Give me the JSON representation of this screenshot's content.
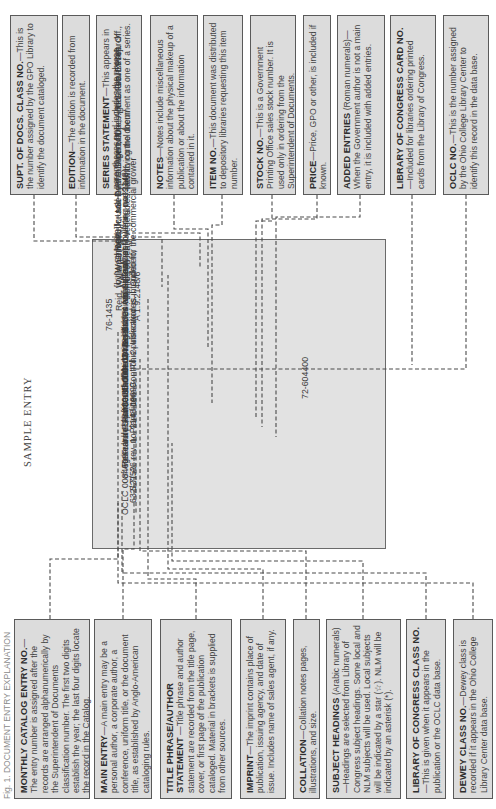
{
  "heading": "SAMPLE ENTRY",
  "caption_strip": "Fig. 1. DOCUMENT ENTRY EXPLANATION",
  "top_boxes": [
    {
      "title": "SUPT. OF DOCS. CLASS NO.",
      "text": "—This is the number assigned by the GPO Library to identify the document cataloged."
    },
    {
      "title": "EDITION",
      "text": "—The edition is recorded from information in the document."
    },
    {
      "title": "SERIES STATEMENT",
      "text": "—This appears in parentheses and includes the phrase identifying the document as one of a series."
    },
    {
      "title": "NOTES",
      "text": "—Notes include miscellaneous information about the physical makeup of a publication or about the information contained in it."
    },
    {
      "title": "ITEM NO.",
      "text": "—This document was distributed to depository libraries requesting this item number."
    },
    {
      "title": "STOCK NO.",
      "text": "—This is a Government Printing Office sales stock number. It is used only in ordering from the Superintendent of Documents."
    },
    {
      "title": "PRICE",
      "text": "—Price, GPO or other, is included if known."
    },
    {
      "title": "ADDED ENTRIES",
      "text": " (Roman numerals)—When the Government author is not a main entry, it is included with added entries."
    },
    {
      "title": "LIBRARY OF CONGRESS CARD NO.",
      "text": "—Included for libraries ordering printed cards from the Library of Congress."
    },
    {
      "title": "OCLC NO.",
      "text": "—This is the number assigned by the Ohio College Library Center to identify this record in the data base."
    }
  ],
  "bottom_boxes": [
    {
      "title": "MONTHLY CATALOG ENTRY NO.",
      "text": "—The entry number is assigned after the records are arranged alphanumerically by the Superintendent of Documents classification number. The first two digits establish the year; the last four digits locate the record in the Catalog."
    },
    {
      "title": "MAIN ENTRY",
      "text": "—A main entry may be a personal author, a corporate author, a conference, uniform title, or the document title, as established by Anglo-American cataloging rules."
    },
    {
      "title": "TITLE PHRASE/AUTHOR STATEMENT",
      "text": " —Title phrase and author statement are recorded from the title page, cover, or first page of the publication cataloged. Material in brackets is supplied from other sources."
    },
    {
      "title": "IMPRINT",
      "text": "—The imprint contains place of publication, issuing agency, and date of issue. Includes name of sales agent, if any."
    },
    {
      "title": "COLLATION",
      "text": "—Collation notes pages, illustrations, and size."
    },
    {
      "title": "SUBJECT HEADINGS",
      "text": " (Arabic numerals) —Headings are selected from Library of Congress subject headings. Some local and NLM subjects will be used. Local subjects will be indicated by a star (☆). NLM will be indicated by an asterisk (*)."
    },
    {
      "title": "LIBRARY OF CONGRESS CLASS NO.",
      "text": "—This is given when it appears in the publication or the OCLC data base."
    },
    {
      "title": "DEWEY CLASS NO.",
      "text": "—Dewey class is recorded if it appears in the Ohio College Library Center data base."
    }
  ],
  "card": {
    "entry_no": "76-1435",
    "class_no": "A 1.9:2148/6",
    "lines": [
      "Reid, William J.",
      "Aphids on leafy vegetables: how to control them/",
      "[by W. J. Reid, Jr., and F. P. Cuthbert, Jr.] — [Rev. Feb. 1976]",
      "[Washington] : U.S. Dept. of Agriculture, Agricultural Research",
      "Service : for sale by the Supt. of Docs., U.S. Govt. Print. Off.,",
      "[1976]",
      "14 p. : ill. ; 24 cm.—(Farmers' bulletin ; no. 2148)",
      "\"This publication is intended for the commercial grower",
      "of those vegetables whose leafy or flowering parts are",
      "marketed.\"",
      "Item 9",
      "S/N 001–000–03478–1",
      "pbk. : $0.35",
      "1. Plant lice – Control.  2. Insecticides.  I. Cuthbert,",
      "Frank P., joint author.  II. United States Agricultural",
      "Research Service.  III. Title.  IV. Series: United States Dept.",
      "of Agriculture.  Farmers' bulletin ; no. 2148.",
      "S21.A6 rev. no. 2148 1969",
      "632/.7/52",
      "OCLC 0084699"
    ],
    "lc_card_no": "72-604400"
  }
}
